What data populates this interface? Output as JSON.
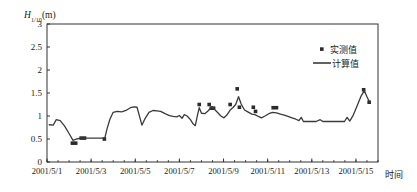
{
  "chart_data": {
    "type": "line",
    "title": "",
    "ylabel": "H_{1/10}(m)",
    "ylabel_main": "H",
    "ylabel_sub": "1/10",
    "ylabel_unit": "(m)",
    "xlabel": "时间",
    "ylim": [
      0,
      3
    ],
    "ytick_labels": [
      "0",
      "0.5",
      "1",
      "1.5",
      "2",
      "2.5",
      "3"
    ],
    "ytick_values": [
      0,
      0.5,
      1,
      1.5,
      2,
      2.5,
      3
    ],
    "xtick_labels": [
      "2001/5/1",
      "2001/5/3",
      "2001/5/5",
      "2001/5/7",
      "2001/5/9",
      "2001/5/11",
      "2001/5/13",
      "2001/5/15"
    ],
    "xtick_values": [
      0,
      2,
      4,
      6,
      8,
      10,
      12,
      14
    ],
    "xlim": [
      0,
      15
    ],
    "grid": false,
    "legend_position": "top-right",
    "series": [
      {
        "name": "实测值",
        "type": "scatter",
        "marker": "square",
        "color": "#2b2b2b",
        "points": [
          {
            "x": 1.15,
            "y": 0.41
          },
          {
            "x": 1.3,
            "y": 0.41
          },
          {
            "x": 1.55,
            "y": 0.52
          },
          {
            "x": 1.7,
            "y": 0.52
          },
          {
            "x": 2.6,
            "y": 0.5
          },
          {
            "x": 6.9,
            "y": 1.25
          },
          {
            "x": 7.35,
            "y": 1.25
          },
          {
            "x": 7.45,
            "y": 1.17
          },
          {
            "x": 7.55,
            "y": 1.17
          },
          {
            "x": 8.3,
            "y": 1.25
          },
          {
            "x": 8.62,
            "y": 1.59
          },
          {
            "x": 8.72,
            "y": 1.19
          },
          {
            "x": 9.35,
            "y": 1.19
          },
          {
            "x": 9.45,
            "y": 1.1
          },
          {
            "x": 10.25,
            "y": 1.18
          },
          {
            "x": 10.4,
            "y": 1.18
          },
          {
            "x": 14.35,
            "y": 1.57
          },
          {
            "x": 14.6,
            "y": 1.3
          }
        ]
      },
      {
        "name": "计算值",
        "type": "line",
        "color": "#3a3a3a",
        "points": [
          {
            "x": 0.1,
            "y": 0.81
          },
          {
            "x": 0.28,
            "y": 0.8
          },
          {
            "x": 0.42,
            "y": 0.92
          },
          {
            "x": 0.6,
            "y": 0.9
          },
          {
            "x": 0.8,
            "y": 0.78
          },
          {
            "x": 1.0,
            "y": 0.62
          },
          {
            "x": 1.18,
            "y": 0.47
          },
          {
            "x": 1.34,
            "y": 0.5
          },
          {
            "x": 1.52,
            "y": 0.52
          },
          {
            "x": 1.72,
            "y": 0.52
          },
          {
            "x": 1.95,
            "y": 0.52
          },
          {
            "x": 2.2,
            "y": 0.52
          },
          {
            "x": 2.45,
            "y": 0.52
          },
          {
            "x": 2.62,
            "y": 0.52
          },
          {
            "x": 2.72,
            "y": 0.72
          },
          {
            "x": 2.85,
            "y": 0.93
          },
          {
            "x": 3.0,
            "y": 1.08
          },
          {
            "x": 3.18,
            "y": 1.1
          },
          {
            "x": 3.38,
            "y": 1.09
          },
          {
            "x": 3.58,
            "y": 1.12
          },
          {
            "x": 3.78,
            "y": 1.18
          },
          {
            "x": 3.95,
            "y": 1.2
          },
          {
            "x": 4.08,
            "y": 1.19
          },
          {
            "x": 4.2,
            "y": 0.98
          },
          {
            "x": 4.3,
            "y": 0.8
          },
          {
            "x": 4.45,
            "y": 0.95
          },
          {
            "x": 4.62,
            "y": 1.08
          },
          {
            "x": 4.8,
            "y": 1.12
          },
          {
            "x": 4.98,
            "y": 1.11
          },
          {
            "x": 5.15,
            "y": 1.1
          },
          {
            "x": 5.35,
            "y": 1.05
          },
          {
            "x": 5.55,
            "y": 1.01
          },
          {
            "x": 5.72,
            "y": 0.99
          },
          {
            "x": 5.88,
            "y": 0.98
          },
          {
            "x": 6.0,
            "y": 1.01
          },
          {
            "x": 6.12,
            "y": 0.95
          },
          {
            "x": 6.22,
            "y": 1.03
          },
          {
            "x": 6.35,
            "y": 1.0
          },
          {
            "x": 6.5,
            "y": 0.92
          },
          {
            "x": 6.62,
            "y": 0.83
          },
          {
            "x": 6.72,
            "y": 0.79
          },
          {
            "x": 6.82,
            "y": 1.02
          },
          {
            "x": 6.9,
            "y": 1.18
          },
          {
            "x": 7.0,
            "y": 1.06
          },
          {
            "x": 7.15,
            "y": 1.05
          },
          {
            "x": 7.32,
            "y": 1.12
          },
          {
            "x": 7.45,
            "y": 1.2
          },
          {
            "x": 7.58,
            "y": 1.15
          },
          {
            "x": 7.72,
            "y": 1.08
          },
          {
            "x": 7.88,
            "y": 1.0
          },
          {
            "x": 8.02,
            "y": 0.96
          },
          {
            "x": 8.15,
            "y": 1.02
          },
          {
            "x": 8.3,
            "y": 1.13
          },
          {
            "x": 8.42,
            "y": 1.18
          },
          {
            "x": 8.55,
            "y": 1.25
          },
          {
            "x": 8.68,
            "y": 1.42
          },
          {
            "x": 8.8,
            "y": 1.26
          },
          {
            "x": 8.95,
            "y": 1.13
          },
          {
            "x": 9.1,
            "y": 1.09
          },
          {
            "x": 9.28,
            "y": 1.04
          },
          {
            "x": 9.42,
            "y": 1.03
          },
          {
            "x": 9.58,
            "y": 0.99
          },
          {
            "x": 9.72,
            "y": 0.96
          },
          {
            "x": 9.88,
            "y": 1.0
          },
          {
            "x": 10.05,
            "y": 1.05
          },
          {
            "x": 10.22,
            "y": 1.08
          },
          {
            "x": 10.4,
            "y": 1.07
          },
          {
            "x": 10.58,
            "y": 1.04
          },
          {
            "x": 10.75,
            "y": 1.02
          },
          {
            "x": 10.92,
            "y": 0.99
          },
          {
            "x": 11.1,
            "y": 0.96
          },
          {
            "x": 11.28,
            "y": 0.93
          },
          {
            "x": 11.42,
            "y": 0.9
          },
          {
            "x": 11.52,
            "y": 0.97
          },
          {
            "x": 11.62,
            "y": 0.88
          },
          {
            "x": 11.8,
            "y": 0.88
          },
          {
            "x": 12.0,
            "y": 0.88
          },
          {
            "x": 12.2,
            "y": 0.88
          },
          {
            "x": 12.38,
            "y": 0.92
          },
          {
            "x": 12.5,
            "y": 0.88
          },
          {
            "x": 12.7,
            "y": 0.88
          },
          {
            "x": 12.9,
            "y": 0.88
          },
          {
            "x": 13.1,
            "y": 0.88
          },
          {
            "x": 13.3,
            "y": 0.88
          },
          {
            "x": 13.48,
            "y": 0.88
          },
          {
            "x": 13.6,
            "y": 0.97
          },
          {
            "x": 13.72,
            "y": 0.89
          },
          {
            "x": 13.88,
            "y": 1.02
          },
          {
            "x": 14.05,
            "y": 1.22
          },
          {
            "x": 14.22,
            "y": 1.42
          },
          {
            "x": 14.38,
            "y": 1.55
          },
          {
            "x": 14.5,
            "y": 1.42
          },
          {
            "x": 14.62,
            "y": 1.3
          }
        ]
      }
    ],
    "legend": [
      {
        "label": "实测值",
        "kind": "marker"
      },
      {
        "label": "计算值",
        "kind": "line"
      }
    ]
  }
}
